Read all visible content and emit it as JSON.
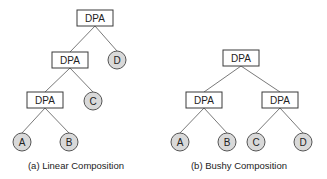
{
  "diagrams": [
    {
      "id": "linear",
      "caption": "(a) Linear Composition",
      "nodes": [
        {
          "id": "l-dpa1",
          "type": "operator",
          "label": "DPA"
        },
        {
          "id": "l-dpa2",
          "type": "operator",
          "label": "DPA"
        },
        {
          "id": "l-d",
          "type": "source",
          "label": "D"
        },
        {
          "id": "l-dpa3",
          "type": "operator",
          "label": "DPA"
        },
        {
          "id": "l-c",
          "type": "source",
          "label": "C"
        },
        {
          "id": "l-a",
          "type": "source",
          "label": "A"
        },
        {
          "id": "l-b",
          "type": "source",
          "label": "B"
        }
      ],
      "edges": [
        [
          "l-dpa1",
          "l-dpa2"
        ],
        [
          "l-dpa1",
          "l-d"
        ],
        [
          "l-dpa2",
          "l-dpa3"
        ],
        [
          "l-dpa2",
          "l-c"
        ],
        [
          "l-dpa3",
          "l-a"
        ],
        [
          "l-dpa3",
          "l-b"
        ]
      ]
    },
    {
      "id": "bushy",
      "caption": "(b) Bushy Composition",
      "nodes": [
        {
          "id": "b-dpa1",
          "type": "operator",
          "label": "DPA"
        },
        {
          "id": "b-dpa2",
          "type": "operator",
          "label": "DPA"
        },
        {
          "id": "b-dpa3",
          "type": "operator",
          "label": "DPA"
        },
        {
          "id": "b-a",
          "type": "source",
          "label": "A"
        },
        {
          "id": "b-b",
          "type": "source",
          "label": "B"
        },
        {
          "id": "b-c",
          "type": "source",
          "label": "C"
        },
        {
          "id": "b-d",
          "type": "source",
          "label": "D"
        }
      ],
      "edges": [
        [
          "b-dpa1",
          "b-dpa2"
        ],
        [
          "b-dpa1",
          "b-dpa3"
        ],
        [
          "b-dpa2",
          "b-a"
        ],
        [
          "b-dpa2",
          "b-b"
        ],
        [
          "b-dpa3",
          "b-c"
        ],
        [
          "b-dpa3",
          "b-d"
        ]
      ]
    }
  ]
}
